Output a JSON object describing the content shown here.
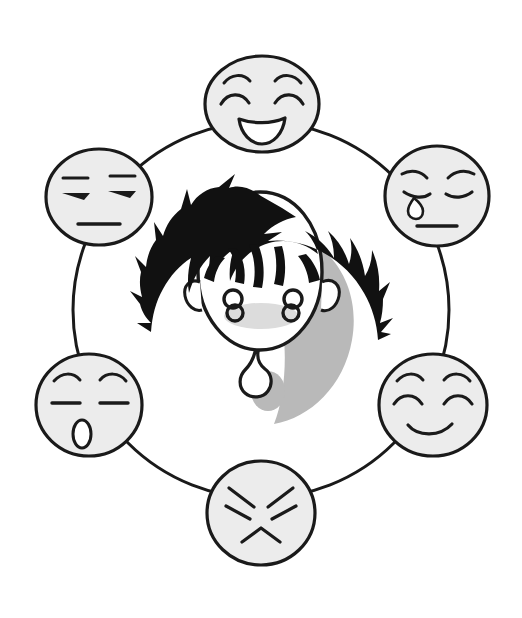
{
  "illustration": {
    "title": "Emotion wheel around a dizzy boy",
    "background_color": "#ffffff",
    "ink_color": "#1a1a1a",
    "face_fill_color": "#ececec",
    "hair_color": "#111111",
    "shadow_color": "#b9b9b9",
    "blush_color": "#dcdcdc",
    "ring": {
      "name": "connecting-ring",
      "center_x": 261,
      "center_y": 310,
      "radius_x": 188,
      "radius_y": 188,
      "stroke_width": 3
    },
    "center_figure": {
      "name": "boy-head",
      "label": "boy with spiky black hair",
      "center_x": 261,
      "center_y": 300,
      "eyes": "dizzy-swirl-eyes",
      "eye_glyph": "8",
      "mouth": "drool-drop",
      "expression": "dizzy"
    },
    "faces": [
      {
        "id": "face-happy",
        "label": "happy",
        "position": "top",
        "cx": 262,
        "cy": 104,
        "rx": 57,
        "ry": 48,
        "eyes": "arched-closed-eyes",
        "eyebrows": "arched-eyebrows",
        "mouth": "open-smile",
        "extra": "none"
      },
      {
        "id": "face-sad",
        "label": "sad",
        "position": "upper-right",
        "cx": 437,
        "cy": 196,
        "rx": 52,
        "ry": 50,
        "eyes": "downturned-closed-eyes",
        "eyebrows": "worried-eyebrows",
        "mouth": "flat-line",
        "extra": "teardrop"
      },
      {
        "id": "face-content",
        "label": "content",
        "position": "lower-right",
        "cx": 433,
        "cy": 405,
        "rx": 54,
        "ry": 51,
        "eyes": "closed-curved-eyes",
        "eyebrows": "arched-eyebrows",
        "mouth": "gentle-smile",
        "extra": "none"
      },
      {
        "id": "face-angry",
        "label": "angry",
        "position": "bottom",
        "cx": 261,
        "cy": 513,
        "rx": 54,
        "ry": 52,
        "eyes": "slanted-angry-eyes",
        "eyebrows": "slanted-angry-eyebrows",
        "mouth": "frown-inverted-v",
        "extra": "none"
      },
      {
        "id": "face-surprised",
        "label": "surprised",
        "position": "lower-left",
        "cx": 89,
        "cy": 405,
        "rx": 53,
        "ry": 51,
        "eyes": "flat-closed-eyes",
        "eyebrows": "arched-eyebrows",
        "mouth": "small-oval-open",
        "extra": "none"
      },
      {
        "id": "face-neutral",
        "label": "neutral",
        "position": "upper-left",
        "cx": 99,
        "cy": 197,
        "rx": 53,
        "ry": 48,
        "eyes": "half-closed-flat-eyes",
        "eyebrows": "flat-eyebrows",
        "mouth": "flat-line",
        "extra": "none"
      }
    ]
  }
}
